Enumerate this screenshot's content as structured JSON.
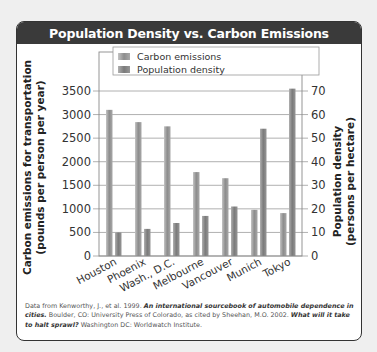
{
  "header": {
    "title": "Population Density vs. Carbon Emissions"
  },
  "chart_data": {
    "type": "bar",
    "title": "Population Density vs. Carbon Emissions",
    "categories": [
      "Houston",
      "Phoenix",
      "Wash., D.C.",
      "Melbourne",
      "Vancouver",
      "Munich",
      "Tokyo"
    ],
    "series": [
      {
        "name": "Carbon emissions",
        "axis": "left",
        "values": [
          3100,
          2840,
          2750,
          1780,
          1650,
          980,
          910
        ]
      },
      {
        "name": "Population density",
        "axis": "right",
        "values": [
          10,
          11.5,
          14,
          17,
          21,
          54,
          71
        ]
      }
    ],
    "ylabel": "Carbon emissions for transportation (pounds per person per year)",
    "ylabel_line1": "Carbon emissions for transportation",
    "ylabel_line2": "(pounds per person per year)",
    "y2label": "Population density (persons per hectare)",
    "y2label_line1": "Population density",
    "y2label_line2": "(persons per hectare)",
    "ylim": [
      0,
      3500
    ],
    "y2lim": [
      0,
      70
    ],
    "yticks": [
      0,
      500,
      1000,
      1500,
      2000,
      2500,
      3000,
      3500
    ],
    "y2ticks": [
      0,
      10,
      20,
      30,
      40,
      50,
      60,
      70
    ],
    "grid": true,
    "legend_position": "top-inside",
    "legend": [
      "Carbon emissions",
      "Population density"
    ]
  },
  "caption": {
    "pre1": "Data from Kenworthy, J., et al. 1999. ",
    "title1": "An international sourcebook of automobile dependence in cities.",
    "mid": " Boulder, CO: University Press of Colorado, as cited by Sheehan, M.O. 2002. ",
    "title2": "What will it take to halt sprawl?",
    "post": " Washington DC: Worldwatch Institute."
  },
  "colors": {
    "header_bg": "#3a3a3a",
    "bar": "#9a9a9a",
    "bar_dark": "#7d7d7d",
    "grid": "#9c9c9c"
  }
}
